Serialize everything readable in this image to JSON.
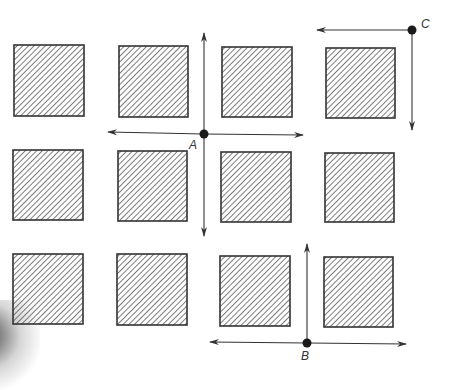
{
  "diagram": {
    "title": "",
    "colors": {
      "line": "#333333",
      "hatch": "#444444",
      "background": "#ffffff",
      "point": "#1a1a1a"
    },
    "blocks": {
      "rows": 3,
      "cols": 4,
      "fill": "diagonal-hatch",
      "items": [
        {
          "row": 1,
          "col": 1,
          "x": 14,
          "y": 45,
          "w": 70,
          "h": 71
        },
        {
          "row": 1,
          "col": 2,
          "x": 119,
          "y": 46,
          "w": 69,
          "h": 71
        },
        {
          "row": 1,
          "col": 3,
          "x": 222,
          "y": 47,
          "w": 70,
          "h": 70
        },
        {
          "row": 1,
          "col": 4,
          "x": 326,
          "y": 48,
          "w": 69,
          "h": 70
        },
        {
          "row": 2,
          "col": 1,
          "x": 13,
          "y": 150,
          "w": 70,
          "h": 70
        },
        {
          "row": 2,
          "col": 2,
          "x": 118,
          "y": 151,
          "w": 69,
          "h": 70
        },
        {
          "row": 2,
          "col": 3,
          "x": 221,
          "y": 152,
          "w": 70,
          "h": 70
        },
        {
          "row": 2,
          "col": 4,
          "x": 325,
          "y": 153,
          "w": 69,
          "h": 69
        },
        {
          "row": 3,
          "col": 1,
          "x": 13,
          "y": 254,
          "w": 70,
          "h": 70
        },
        {
          "row": 3,
          "col": 2,
          "x": 117,
          "y": 254,
          "w": 70,
          "h": 71
        },
        {
          "row": 3,
          "col": 3,
          "x": 220,
          "y": 256,
          "w": 70,
          "h": 70
        },
        {
          "row": 3,
          "col": 4,
          "x": 324,
          "y": 257,
          "w": 69,
          "h": 70
        }
      ]
    },
    "points": [
      {
        "id": "A",
        "label": "A",
        "x": 204,
        "y": 134,
        "label_x": 189,
        "label_y": 138,
        "arrows": [
          {
            "dir": "up",
            "to": [
              204,
              33
            ]
          },
          {
            "dir": "down",
            "to": [
              204,
              236
            ]
          },
          {
            "dir": "left",
            "to": [
              108,
              132
            ]
          },
          {
            "dir": "right",
            "to": [
              303,
              135
            ]
          }
        ]
      },
      {
        "id": "B",
        "label": "B",
        "x": 307,
        "y": 343,
        "label_x": 301,
        "label_y": 349,
        "arrows": [
          {
            "dir": "up",
            "to": [
              307,
              244
            ]
          },
          {
            "dir": "left",
            "to": [
              210,
              342
            ]
          },
          {
            "dir": "right",
            "to": [
              406,
              344
            ]
          }
        ]
      },
      {
        "id": "C",
        "label": "C",
        "x": 412,
        "y": 30,
        "label_x": 421,
        "label_y": 17,
        "arrows": [
          {
            "dir": "left",
            "to": [
              317,
              30
            ]
          },
          {
            "dir": "down",
            "to": [
              412,
              130
            ]
          }
        ]
      }
    ]
  }
}
